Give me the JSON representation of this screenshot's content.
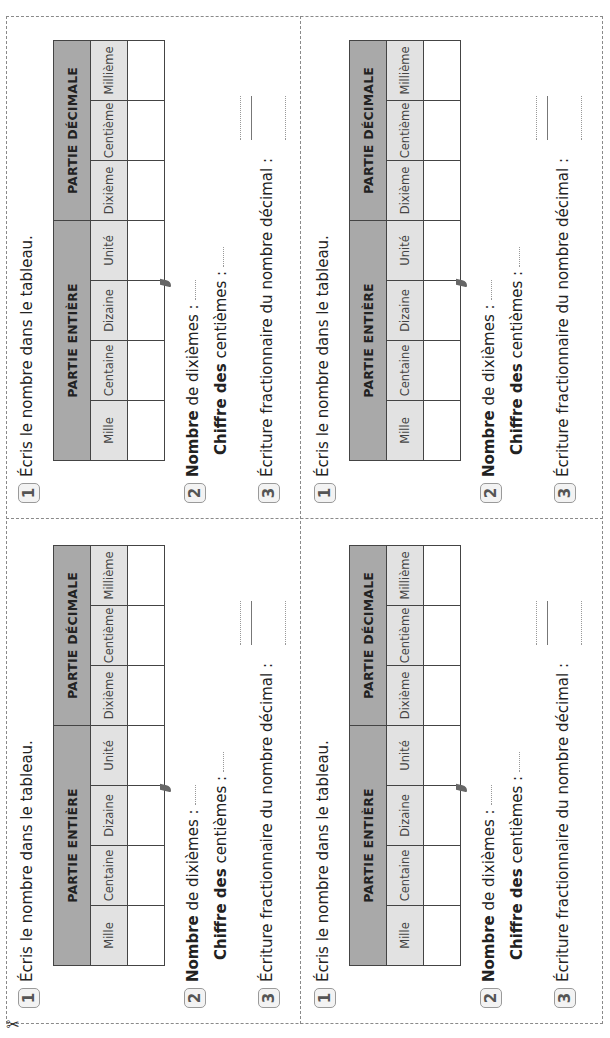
{
  "scissors_icon": "✂",
  "cards": [
    {
      "q1_number": "1",
      "q1_text": "Écris le nombre dans le tableau.",
      "table": {
        "groups": [
          "PARTIE ENTIÈRE",
          "PARTIE DÉCIMALE"
        ],
        "columns": [
          "Mille",
          "Centaine",
          "Dizaine",
          "Unité",
          "Dixième",
          "Centième",
          "Millième"
        ],
        "values": [
          "",
          "",
          "",
          "",
          "",
          "",
          ""
        ]
      },
      "q2_number": "2",
      "q2a_bold": "Nombre",
      "q2a_rest": " de dixièmes :",
      "q2b_bold": "Chiffre des",
      "q2b_rest": " centièmes :",
      "q3_number": "3",
      "q3_text": "Écriture fractionnaire du nombre décimal :"
    },
    {
      "q1_number": "1",
      "q1_text": "Écris le nombre dans le tableau.",
      "table": {
        "groups": [
          "PARTIE ENTIÈRE",
          "PARTIE DÉCIMALE"
        ],
        "columns": [
          "Mille",
          "Centaine",
          "Dizaine",
          "Unité",
          "Dixième",
          "Centième",
          "Millième"
        ],
        "values": [
          "",
          "",
          "",
          "",
          "",
          "",
          ""
        ]
      },
      "q2_number": "2",
      "q2a_bold": "Nombre",
      "q2a_rest": " de dixièmes :",
      "q2b_bold": "Chiffre des",
      "q2b_rest": " centièmes :",
      "q3_number": "3",
      "q3_text": "Écriture fractionnaire du nombre décimal :"
    },
    {
      "q1_number": "1",
      "q1_text": "Écris le nombre dans le tableau.",
      "table": {
        "groups": [
          "PARTIE ENTIÈRE",
          "PARTIE DÉCIMALE"
        ],
        "columns": [
          "Mille",
          "Centaine",
          "Dizaine",
          "Unité",
          "Dixième",
          "Centième",
          "Millième"
        ],
        "values": [
          "",
          "",
          "",
          "",
          "",
          "",
          ""
        ]
      },
      "q2_number": "2",
      "q2a_bold": "Nombre",
      "q2a_rest": " de dixièmes :",
      "q2b_bold": "Chiffre des",
      "q2b_rest": " centièmes :",
      "q3_number": "3",
      "q3_text": "Écriture fractionnaire du nombre décimal :"
    },
    {
      "q1_number": "1",
      "q1_text": "Écris le nombre dans le tableau.",
      "table": {
        "groups": [
          "PARTIE ENTIÈRE",
          "PARTIE DÉCIMALE"
        ],
        "columns": [
          "Mille",
          "Centaine",
          "Dizaine",
          "Unité",
          "Dixième",
          "Centième",
          "Millième"
        ],
        "values": [
          "",
          "",
          "",
          "",
          "",
          "",
          ""
        ]
      },
      "q2_number": "2",
      "q2a_bold": "Nombre",
      "q2a_rest": " de dixièmes :",
      "q2b_bold": "Chiffre des",
      "q2b_rest": " centièmes :",
      "q3_number": "3",
      "q3_text": "Écriture fractionnaire du nombre décimal :"
    }
  ]
}
